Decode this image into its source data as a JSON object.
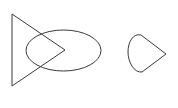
{
  "canvas": {
    "width": 178,
    "height": 108,
    "background_color": "#ffffff",
    "stroke_color": "#3a3a3a",
    "stroke_width": 1,
    "fill": "none",
    "title": "Geometric line drawing"
  },
  "figure": {
    "shape_count": 3,
    "shapes": [
      {
        "id": "triangle",
        "name": "right-pointing-triangle",
        "type": "polygon",
        "label": "Triangle",
        "points": "12,14 65,50 12,86",
        "vertices": [
          {
            "x": 12,
            "y": 14,
            "label": "top-left-vertex"
          },
          {
            "x": 65,
            "y": 50,
            "label": "right-apex"
          },
          {
            "x": 12,
            "y": 86,
            "label": "bottom-left-vertex"
          }
        ],
        "bbox": {
          "x": 12,
          "y": 14,
          "width": 53,
          "height": 72
        }
      },
      {
        "id": "ellipse",
        "name": "horizontal-ellipse",
        "type": "ellipse",
        "label": "Ellipse",
        "cx": 63.5,
        "cy": 50.5,
        "rx": 37.5,
        "ry": 20.5,
        "bbox": {
          "x": 26,
          "y": 30,
          "width": 75,
          "height": 41
        }
      },
      {
        "id": "teardrop",
        "name": "teardrop-wedge",
        "type": "path",
        "label": "Teardrop",
        "path": "M 166 54 L 141 35 C 133 33 128 42 128 52 C 128 62 134 73 142 72 Z",
        "point_tip": {
          "x": 166,
          "y": 54,
          "label": "right-point"
        },
        "bbox": {
          "x": 128,
          "y": 33,
          "width": 38,
          "height": 39
        }
      }
    ]
  }
}
